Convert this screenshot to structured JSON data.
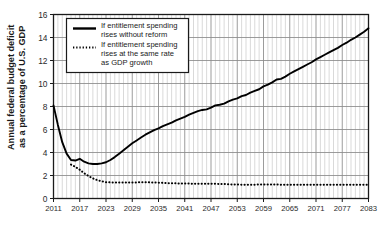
{
  "chart_data": {
    "type": "line",
    "title": "",
    "xlabel": "",
    "ylabel": "Annual federal budget deficit as a percentage of U.S. GDP",
    "ylabel_line1": "Annual federal budget deficit",
    "ylabel_line2": "as a percentage of U.S. GDP",
    "xlim": [
      2011,
      2083
    ],
    "ylim": [
      0,
      16
    ],
    "yticks": [
      0,
      2,
      4,
      6,
      8,
      10,
      12,
      14,
      16
    ],
    "ytick_labels": [
      "0",
      "2",
      "4",
      "6",
      "8",
      "10",
      "12",
      "14",
      "16"
    ],
    "xticks": [
      2011,
      2017,
      2023,
      2029,
      2035,
      2041,
      2047,
      2053,
      2059,
      2065,
      2071,
      2077,
      2083
    ],
    "xtick_labels": [
      "2011",
      "2017",
      "2023",
      "2029",
      "2035",
      "2041",
      "2047",
      "2053",
      "2059",
      "2065",
      "2071",
      "2077",
      "2083"
    ],
    "grid": true,
    "grid_minor_interval": 1,
    "grid_major_interval": 6,
    "legend_position": "upper left",
    "legend": [
      {
        "name": "If entitlement spending rises without reform",
        "line1": "If entitlement spending",
        "line2": "rises without reform",
        "style": "solid",
        "color": "#000000"
      },
      {
        "name": "If entitlement spending rises at the same rate as GDP growth",
        "line1": "If entitlement spending",
        "line2": "rises at the same rate",
        "line3": "as GDP growth",
        "style": "dotted",
        "color": "#000000"
      }
    ],
    "series": [
      {
        "name": "If entitlement spending rises without reform",
        "style": "solid",
        "color": "#000000",
        "x": [
          2011,
          2012,
          2013,
          2014,
          2015,
          2016,
          2017,
          2018,
          2019,
          2020,
          2021,
          2022,
          2023,
          2024,
          2025,
          2026,
          2027,
          2028,
          2029,
          2030,
          2031,
          2032,
          2033,
          2034,
          2035,
          2036,
          2037,
          2038,
          2039,
          2040,
          2041,
          2042,
          2043,
          2044,
          2045,
          2046,
          2047,
          2048,
          2049,
          2050,
          2051,
          2052,
          2053,
          2054,
          2055,
          2056,
          2057,
          2058,
          2059,
          2060,
          2061,
          2062,
          2063,
          2064,
          2065,
          2066,
          2067,
          2068,
          2069,
          2070,
          2071,
          2072,
          2073,
          2074,
          2075,
          2076,
          2077,
          2078,
          2079,
          2080,
          2081,
          2082,
          2083
        ],
        "y": [
          8.1,
          6.4,
          4.9,
          3.9,
          3.35,
          3.3,
          3.45,
          3.2,
          3.05,
          3.0,
          3.0,
          3.05,
          3.15,
          3.35,
          3.6,
          3.9,
          4.2,
          4.5,
          4.8,
          5.05,
          5.3,
          5.55,
          5.75,
          5.95,
          6.1,
          6.3,
          6.45,
          6.6,
          6.8,
          6.95,
          7.1,
          7.3,
          7.45,
          7.6,
          7.7,
          7.75,
          7.9,
          8.1,
          8.15,
          8.25,
          8.45,
          8.6,
          8.7,
          8.9,
          9.0,
          9.2,
          9.35,
          9.5,
          9.75,
          9.9,
          10.1,
          10.35,
          10.4,
          10.6,
          10.85,
          11.05,
          11.25,
          11.45,
          11.65,
          11.85,
          12.1,
          12.3,
          12.5,
          12.7,
          12.9,
          13.1,
          13.35,
          13.55,
          13.8,
          14.0,
          14.25,
          14.5,
          14.8
        ]
      },
      {
        "name": "If entitlement spending rises at the same rate as GDP growth",
        "style": "dotted",
        "color": "#000000",
        "x": [
          2015,
          2016,
          2017,
          2018,
          2019,
          2020,
          2021,
          2022,
          2023,
          2024,
          2025,
          2026,
          2027,
          2028,
          2029,
          2030,
          2031,
          2032,
          2033,
          2034,
          2035,
          2036,
          2037,
          2038,
          2039,
          2040,
          2041,
          2042,
          2043,
          2044,
          2045,
          2046,
          2047,
          2048,
          2049,
          2050,
          2051,
          2052,
          2053,
          2054,
          2055,
          2056,
          2057,
          2058,
          2059,
          2060,
          2061,
          2062,
          2063,
          2064,
          2065,
          2066,
          2067,
          2068,
          2069,
          2070,
          2071,
          2072,
          2073,
          2074,
          2075,
          2076,
          2077,
          2078,
          2079,
          2080,
          2081,
          2082,
          2083
        ],
        "y": [
          2.95,
          2.75,
          2.5,
          2.2,
          1.95,
          1.75,
          1.6,
          1.5,
          1.42,
          1.4,
          1.4,
          1.4,
          1.4,
          1.4,
          1.4,
          1.4,
          1.42,
          1.42,
          1.4,
          1.4,
          1.38,
          1.36,
          1.34,
          1.32,
          1.32,
          1.3,
          1.3,
          1.3,
          1.28,
          1.28,
          1.28,
          1.28,
          1.28,
          1.28,
          1.26,
          1.26,
          1.24,
          1.22,
          1.22,
          1.2,
          1.2,
          1.2,
          1.2,
          1.22,
          1.22,
          1.22,
          1.22,
          1.22,
          1.2,
          1.2,
          1.2,
          1.2,
          1.2,
          1.2,
          1.2,
          1.2,
          1.2,
          1.2,
          1.2,
          1.2,
          1.2,
          1.2,
          1.2,
          1.2,
          1.2,
          1.2,
          1.2,
          1.2,
          1.2
        ]
      }
    ]
  },
  "colors": {
    "line": "#000000",
    "frame": "#1a1a1a",
    "grid_minor": "#c8c8c8",
    "grid_major": "#8a8a8a",
    "background": "#ffffff"
  }
}
